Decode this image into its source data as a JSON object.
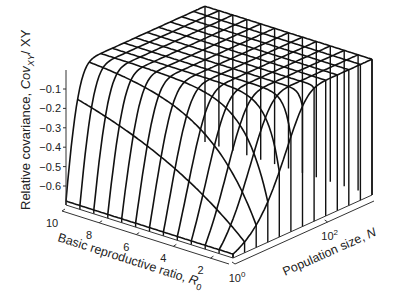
{
  "chart_data": {
    "type": "surface3d",
    "title": "",
    "zlabel": "Relative covariance, Cov_XY / XY",
    "zlabel_main": "Relative covariance, ",
    "zlabel_sym": "Cov",
    "zlabel_sub": "XY",
    "zlabel_tail": "/ XY",
    "xlabel_main": "Basic reproductive ratio, ",
    "xlabel_sym": "R",
    "xlabel_sub": "0",
    "ylabel_main": "Population size, ",
    "ylabel_sym": "N",
    "z_ticks": [
      "-0.1",
      "-0.2",
      "-0.3",
      "-0.4",
      "-0.5",
      "-0.6"
    ],
    "z_tick_values": [
      -0.1,
      -0.2,
      -0.3,
      -0.4,
      -0.5,
      -0.6
    ],
    "x_ticks": [
      "10",
      "8",
      "6",
      "4",
      "2"
    ],
    "x_tick_values": [
      10,
      8,
      6,
      4,
      2
    ],
    "y_ticks": [
      {
        "base": "10",
        "exp": "0"
      },
      {
        "base": "10",
        "exp": "2"
      }
    ],
    "y_tick_values": [
      1,
      100
    ],
    "xlim": [
      1,
      10
    ],
    "ylim_log10": [
      0,
      3
    ],
    "zlim": [
      -0.7,
      0
    ],
    "grid": false,
    "mesh_rows_R0": 13,
    "mesh_cols_N": 13
  }
}
